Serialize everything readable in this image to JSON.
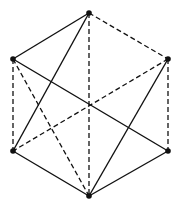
{
  "diagram": {
    "type": "graph",
    "colors": {
      "line": "#111111",
      "background": "#ffffff"
    },
    "vertices": [
      {
        "id": "T",
        "x": 89,
        "y": 13
      },
      {
        "id": "UL",
        "x": 13,
        "y": 59
      },
      {
        "id": "UR",
        "x": 168,
        "y": 59
      },
      {
        "id": "LL",
        "x": 13,
        "y": 151
      },
      {
        "id": "LR",
        "x": 168,
        "y": 151
      },
      {
        "id": "B",
        "x": 89,
        "y": 196
      }
    ],
    "edges": [
      {
        "from": "T",
        "to": "UL",
        "style": "solid"
      },
      {
        "from": "T",
        "to": "UR",
        "style": "dashed"
      },
      {
        "from": "T",
        "to": "B",
        "style": "dashed"
      },
      {
        "from": "T",
        "to": "LL",
        "style": "solid"
      },
      {
        "from": "UL",
        "to": "LL",
        "style": "dashed"
      },
      {
        "from": "UL",
        "to": "LR",
        "style": "solid"
      },
      {
        "from": "UL",
        "to": "B",
        "style": "dashed"
      },
      {
        "from": "UR",
        "to": "LR",
        "style": "dashed"
      },
      {
        "from": "UR",
        "to": "LL",
        "style": "dashed"
      },
      {
        "from": "UR",
        "to": "B",
        "style": "solid"
      },
      {
        "from": "LL",
        "to": "B",
        "style": "solid"
      },
      {
        "from": "LR",
        "to": "B",
        "style": "solid"
      }
    ]
  }
}
